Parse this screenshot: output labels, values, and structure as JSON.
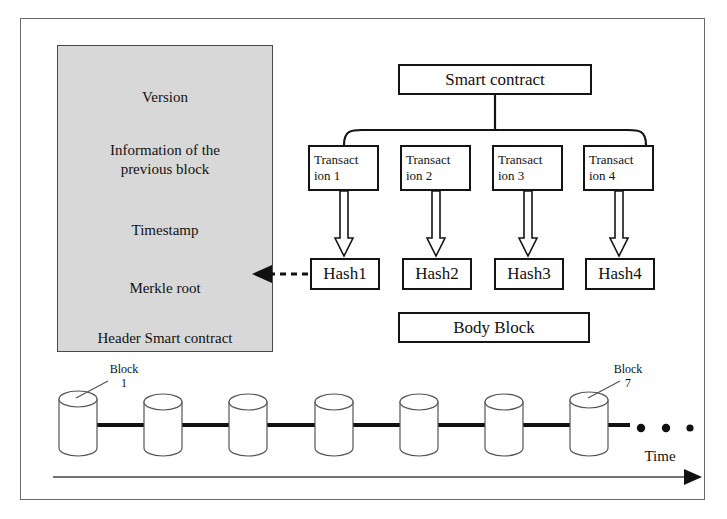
{
  "diagram": {
    "colors": {
      "header_fill": "#d8d8d8",
      "box_stroke": "#141414",
      "frame_stroke": "#6a6a6a",
      "text": "#111111"
    }
  },
  "header_block": {
    "label_version": "Version",
    "label_previous_block": "Information of the\nprevious block",
    "label_previous_block_line1": "Information of the",
    "label_previous_block_line2": "previous block",
    "label_timestamp": "Timestamp",
    "label_merkle_root": "Merkle root",
    "footer": "Header Smart contract"
  },
  "smart_contract": {
    "label": "Smart contract"
  },
  "transactions": [
    {
      "line1": "Transact",
      "line2": "ion 1"
    },
    {
      "line1": "Transact",
      "line2": "ion 2"
    },
    {
      "line1": "Transact",
      "line2": "ion 3"
    },
    {
      "line1": "Transact",
      "line2": "ion 4"
    }
  ],
  "hashes": [
    {
      "label": "Hash1"
    },
    {
      "label": "Hash2"
    },
    {
      "label": "Hash3"
    },
    {
      "label": "Hash4"
    }
  ],
  "body_block": {
    "label": "Body Block"
  },
  "chain": {
    "block_count": 7,
    "first_block_label_line1": "Block",
    "first_block_label_line2": "1",
    "last_block_label_line1": "Block",
    "last_block_label_line2": "7",
    "ellipsis_dots": 3,
    "time_axis_label": "Time"
  }
}
